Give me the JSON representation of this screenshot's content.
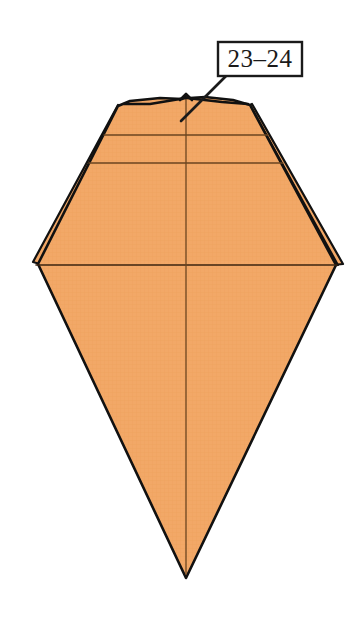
{
  "figure": {
    "background_color": "#ffffff",
    "paper": {
      "fill_color": "#F2A867",
      "fill_color_shade": "#EDA05E",
      "outline_color": "#111111",
      "crease_color": "#8a5a2b",
      "outline_width": 2.6,
      "crease_width": 1.1
    },
    "callout": {
      "label": "23–24",
      "box": {
        "x": 218,
        "y": 42,
        "width": 84,
        "height": 34,
        "fill": "#ffffff",
        "border_color": "#1a1a1a",
        "border_width": 2.4
      },
      "leader_line": {
        "color": "#1a1a1a",
        "width": 2.6,
        "from_x": 226,
        "from_y": 76,
        "to_x": 181,
        "to_y": 121
      }
    },
    "geometry": {
      "apex_top": {
        "x": 186,
        "y": 95
      },
      "apex_bottom": {
        "x": 186,
        "y": 578
      },
      "corner_left": {
        "x": 35,
        "y": 265
      },
      "corner_right": {
        "x": 338,
        "y": 265
      },
      "top_left_shoulder": {
        "x": 118,
        "y": 105
      },
      "top_right_shoulder": {
        "x": 252,
        "y": 104
      },
      "crease_horizontal_1_y": 135,
      "crease_horizontal_2_y": 163,
      "crease_horizontal_mid_y": 265,
      "crease_vertical_x": 186,
      "layer_edges_left": 2,
      "layer_edges_right": 3
    }
  }
}
